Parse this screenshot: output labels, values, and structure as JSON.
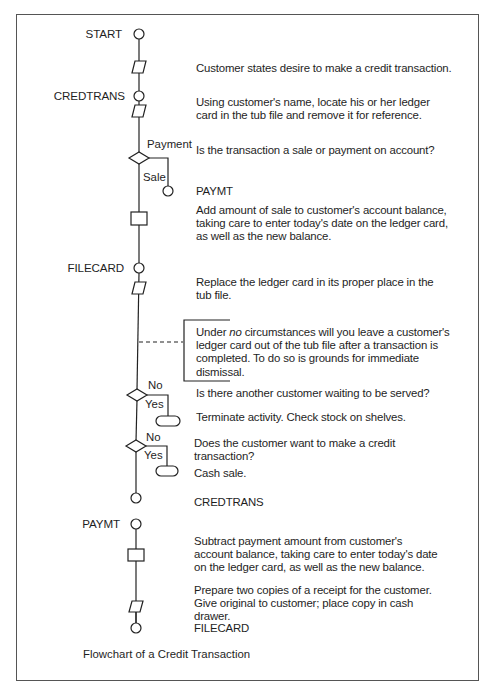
{
  "diagram": {
    "caption": "Flowchart of a Credit Transaction",
    "connector_labels": {
      "start": "START",
      "credtrans": "CREDTRANS",
      "filecard": "FILECARD",
      "paymt": "PAYMT"
    },
    "branch_labels": {
      "d1_payment": "Payment",
      "d1_sale": "Sale",
      "d2_no": "No",
      "d2_yes": "Yes",
      "d3_no": "No",
      "d3_yes": "Yes"
    },
    "steps": {
      "s1": "Customer states desire to make a credit transaction.",
      "s2": "Using customer's name, locate his or her ledger card in the tub file and remove it for reference.",
      "d1": "Is the transaction a sale or payment on account?",
      "d1_target": "PAYMT",
      "s3": "Add amount of sale to customer's account balance, taking care to enter today's date on the ledger card, as well as the new balance.",
      "s4": "Replace the ledger card in its proper place in the tub file.",
      "note_pre": "Under ",
      "note_em": "no",
      "note_post": " circumstances will you leave a customer's ledger card out of the tub file after a transaction is completed. To do so is grounds for immediate dismissal.",
      "d2": "Is there another customer waiting to be served?",
      "t1": "Terminate activity. Check stock on shelves.",
      "d3": "Does the customer want to make a credit transaction?",
      "t2": "Cash sale.",
      "c_end1": "CREDTRANS",
      "s5": "Subtract payment amount from customer's account balance, taking care to enter today's date on the ledger card, as well as the new balance.",
      "s6": "Prepare two copies of a receipt for the customer. Give original to customer; place copy in cash drawer.",
      "c_end2": "FILECARD"
    }
  }
}
